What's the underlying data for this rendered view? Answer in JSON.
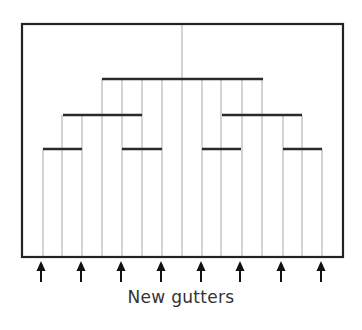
{
  "diagram": {
    "caption": "New gutters",
    "colors": {
      "frame": "#222222",
      "bar": "#2a2a2a",
      "line": "#b8b8b8",
      "arrow": "#111111",
      "text": "#333333"
    },
    "frame": {
      "x1": 22,
      "y1": 24,
      "x2": 343,
      "y2": 257
    },
    "vertical_lines_x": [
      43,
      62,
      82,
      102,
      122,
      142,
      162,
      182,
      202,
      221,
      242,
      262,
      283,
      302,
      322
    ],
    "center_line_x": 182,
    "bars": [
      {
        "level": 1,
        "y": 79,
        "x1": 102,
        "x2": 263
      },
      {
        "level": 2,
        "y": 115,
        "x1": 63,
        "x2": 142
      },
      {
        "level": 2,
        "y": 115,
        "x1": 222,
        "x2": 302
      },
      {
        "level": 3,
        "y": 149,
        "x1": 43,
        "x2": 82
      },
      {
        "level": 3,
        "y": 149,
        "x1": 122,
        "x2": 162
      },
      {
        "level": 3,
        "y": 149,
        "x1": 202,
        "x2": 241
      },
      {
        "level": 3,
        "y": 149,
        "x1": 283,
        "x2": 322
      }
    ],
    "arrows_x": [
      41,
      81,
      121,
      161,
      201,
      240,
      281,
      321
    ],
    "arrow": {
      "tip_y": 261,
      "tail_y": 282
    }
  }
}
